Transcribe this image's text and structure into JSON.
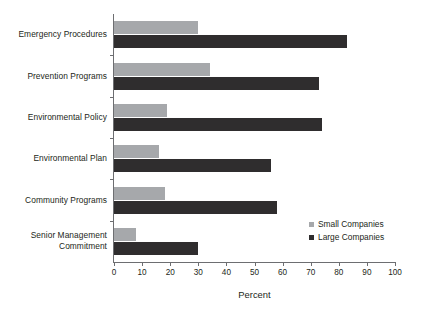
{
  "chart_data": {
    "type": "bar",
    "orientation": "horizontal",
    "title": "",
    "xlabel": "Percent",
    "ylabel": "",
    "xlim": [
      0,
      100
    ],
    "xticks": [
      0,
      10,
      20,
      30,
      40,
      50,
      60,
      70,
      80,
      90,
      100
    ],
    "grid": false,
    "legend_position": "inside-right-bottom",
    "categories": [
      "Emergency Procedures",
      "Prevention Programs",
      "Environmental Policy",
      "Environmental Plan",
      "Community Programs",
      "Senior Management Commitment"
    ],
    "series": [
      {
        "name": "Small Companies",
        "color": "#a6a8ab",
        "values": [
          30,
          34,
          19,
          16,
          18,
          8
        ]
      },
      {
        "name": "Large Companies",
        "color": "#2f2d2e",
        "values": [
          83,
          73,
          74,
          56,
          58,
          30
        ]
      }
    ]
  },
  "axis": {
    "x_title": "Percent",
    "tick_labels": [
      "0",
      "10",
      "20",
      "30",
      "40",
      "50",
      "60",
      "70",
      "80",
      "90",
      "100"
    ]
  },
  "category_labels": [
    {
      "line1": "Emergency Procedures",
      "line2": ""
    },
    {
      "line1": "Prevention Programs",
      "line2": ""
    },
    {
      "line1": "Environmental Policy",
      "line2": ""
    },
    {
      "line1": "Environmental Plan",
      "line2": ""
    },
    {
      "line1": "Community Programs",
      "line2": ""
    },
    {
      "line1": "Senior Management",
      "line2": "Commitment"
    }
  ],
  "legend": {
    "entries": [
      {
        "label": "Small Companies",
        "color": "#a6a8ab"
      },
      {
        "label": "Large Companies",
        "color": "#2f2d2e"
      }
    ]
  },
  "artifact": {
    "bottom_text": ""
  }
}
